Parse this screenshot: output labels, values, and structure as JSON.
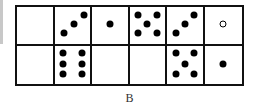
{
  "figure": {
    "label": "B",
    "rows": 2,
    "cols": 6,
    "cells": [
      {
        "row": 0,
        "col": 0,
        "dots": []
      },
      {
        "row": 0,
        "col": 1,
        "dots": [
          [
            28,
            70
          ],
          [
            55,
            47
          ],
          [
            82,
            23
          ]
        ]
      },
      {
        "row": 0,
        "col": 2,
        "dots": [
          [
            50,
            47
          ]
        ]
      },
      {
        "row": 0,
        "col": 3,
        "dots": [
          [
            25,
            23
          ],
          [
            77,
            23
          ],
          [
            50,
            47
          ],
          [
            25,
            70
          ],
          [
            77,
            70
          ]
        ]
      },
      {
        "row": 0,
        "col": 4,
        "dots": [
          [
            25,
            70
          ],
          [
            50,
            47
          ],
          [
            77,
            23
          ]
        ]
      },
      {
        "row": 0,
        "col": 5,
        "dots": [
          [
            50,
            47
          ]
        ],
        "hollow": true
      },
      {
        "row": 1,
        "col": 0,
        "dots": []
      },
      {
        "row": 1,
        "col": 1,
        "dots": [
          [
            25,
            20
          ],
          [
            77,
            20
          ],
          [
            25,
            47
          ],
          [
            77,
            47
          ],
          [
            25,
            74
          ],
          [
            77,
            74
          ]
        ]
      },
      {
        "row": 1,
        "col": 2,
        "dots": []
      },
      {
        "row": 1,
        "col": 3,
        "dots": []
      },
      {
        "row": 1,
        "col": 4,
        "dots": [
          [
            25,
            20
          ],
          [
            77,
            20
          ],
          [
            50,
            47
          ],
          [
            25,
            74
          ],
          [
            77,
            74
          ]
        ]
      },
      {
        "row": 1,
        "col": 5,
        "dots": [
          [
            50,
            47
          ]
        ]
      }
    ]
  }
}
